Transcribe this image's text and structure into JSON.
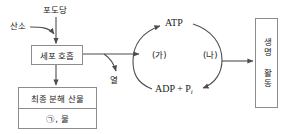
{
  "diagram": {
    "colors": {
      "stroke": "#8c8c8c",
      "arrow": "#4d4d4d",
      "text": "#222222",
      "background": "#ffffff"
    },
    "inputs": {
      "glucose_label": "포도당",
      "oxygen_label": "산소"
    },
    "process_box": {
      "label": "세포 호흡"
    },
    "byproduct": {
      "heat_label": "열"
    },
    "products_box": {
      "header": "최종 분해 산물",
      "contents": "㉠, 물"
    },
    "cycle": {
      "top_label": "ATP",
      "bottom_label_main": "ADP + P",
      "bottom_label_sub": "i",
      "left_label": "(가)",
      "right_label": "(나)"
    },
    "output_box": {
      "label": "생명 활동"
    }
  }
}
